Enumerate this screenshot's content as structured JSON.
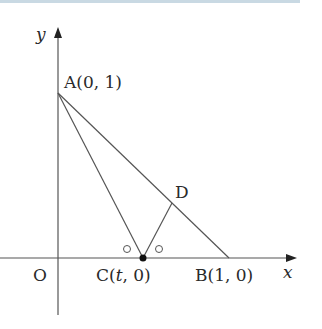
{
  "diagram": {
    "axes": {
      "x_label": "x",
      "y_label": "y",
      "origin_label": "O"
    },
    "points": {
      "A": {
        "label": "A(0, 1)",
        "px": [
          58,
          93
        ]
      },
      "B": {
        "label": "B(1, 0)",
        "px": [
          229,
          258
        ]
      },
      "C": {
        "label_prefix": "C(",
        "label_var": "t",
        "label_suffix": ", 0)",
        "px": [
          143,
          258
        ]
      },
      "D": {
        "label": "D",
        "px": [
          172,
          203
        ]
      }
    },
    "segments": [
      "AB",
      "AC",
      "CD"
    ],
    "angle_marks": [
      "angle ACO",
      "angle DCB"
    ],
    "colors": {
      "line": "#555555",
      "text": "#2a2a2a",
      "top_band": "#c9d9e3"
    }
  }
}
